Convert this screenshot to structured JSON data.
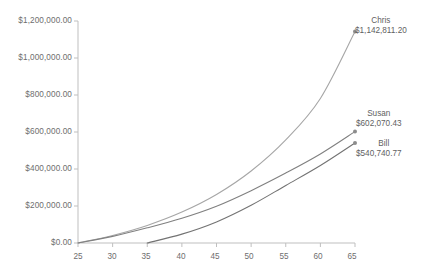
{
  "chart_data": {
    "type": "line",
    "title": "",
    "xlabel": "",
    "ylabel": "",
    "xlim": [
      25,
      65
    ],
    "ylim": [
      0,
      1200000
    ],
    "grid": false,
    "legend_position": "none",
    "x_ticks": [
      "25",
      "30",
      "35",
      "40",
      "45",
      "50",
      "55",
      "60",
      "65"
    ],
    "x_tick_values": [
      25,
      30,
      35,
      40,
      45,
      50,
      55,
      60,
      65
    ],
    "y_ticks": [
      "$0.00",
      "$200,000.00",
      "$400,000.00",
      "$600,000.00",
      "$800,000.00",
      "$1,000,000.00",
      "$1,200,000.00"
    ],
    "y_tick_values": [
      0,
      200000,
      400000,
      600000,
      800000,
      1000000,
      1200000
    ],
    "series": [
      {
        "name": "Chris",
        "color": "#a6a6a6",
        "end_label_name": "Chris",
        "end_label_value": "$1,142,811.20",
        "end_x": 65,
        "end_y": 1142811.2,
        "x": [
          25,
          30,
          35,
          40,
          45,
          50,
          55,
          60,
          65
        ],
        "values": [
          0,
          41000,
          95000,
          167000,
          262000,
          389000,
          557000,
          781000,
          1142811.2
        ]
      },
      {
        "name": "Susan",
        "color": "#808080",
        "end_label_name": "Susan",
        "end_label_value": "$602,070.43",
        "end_x": 65,
        "end_y": 602070.43,
        "x": [
          25,
          30,
          35,
          40,
          45,
          50,
          55,
          60,
          65
        ],
        "values": [
          0,
          36000,
          82000,
          134000,
          199000,
          283000,
          378000,
          481000,
          602070.43
        ]
      },
      {
        "name": "Bill",
        "color": "#737373",
        "end_label_name": "Bill",
        "end_label_value": "$540,740.77",
        "end_x": 65,
        "end_y": 540740.77,
        "x": [
          35,
          40,
          45,
          50,
          55,
          60,
          65
        ],
        "values": [
          0,
          48000,
          114000,
          204000,
          311000,
          419000,
          540740.77
        ]
      }
    ],
    "axis_color": "#bfbfbf",
    "tick_color": "#bfbfbf",
    "marker_color": "#8c8c8c"
  }
}
